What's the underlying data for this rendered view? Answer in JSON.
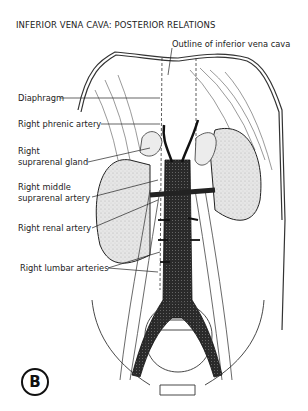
{
  "figure": {
    "title": "INFERIOR VENA CAVA: POSTERIOR RELATIONS",
    "panel_label": "B",
    "labels": {
      "outline_ivc": "Outline of inferior vena cava",
      "diaphragm": "Diaphragm",
      "right_phrenic_artery": "Right phrenic artery",
      "right_suprarenal_gland_1": "Right",
      "right_suprarenal_gland_2": "suprarenal gland",
      "right_middle_suprarenal_artery_1": "Right middle",
      "right_middle_suprarenal_artery_2": "suprarenal artery",
      "right_renal_artery": "Right renal artery",
      "right_lumbar_arteries": "Right lumbar arteries"
    },
    "colors": {
      "ink": "#222222",
      "vessel": "#2a2a2a",
      "kidney_fill": "#e4e4e4",
      "gland_fill": "#ececec",
      "background": "#ffffff"
    }
  }
}
